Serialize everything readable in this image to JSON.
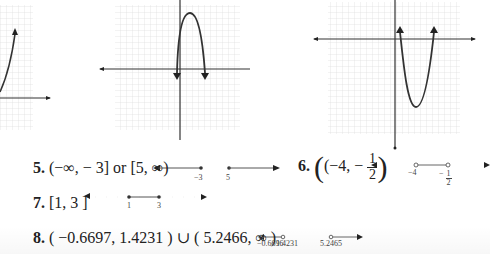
{
  "graphs": [
    {
      "id": "graph-partial-left",
      "description": "increasing curve with arrow, partially cropped"
    },
    {
      "id": "graph-downward-parabola",
      "description": "parabola opening down, vertex above x-axis"
    },
    {
      "id": "graph-upward-parabola",
      "description": "parabola opening up, vertex below x-axis"
    }
  ],
  "answers": [
    {
      "number": "5.",
      "text": "(−∞, − 3] or [5, ∞)",
      "number_line": {
        "labels": [
          "−3",
          "5"
        ],
        "endpoints": "closed"
      }
    },
    {
      "number": "6.",
      "text_before": "(−4, −",
      "frac_num": "1",
      "frac_den": "2",
      "text_after": ")",
      "number_line": {
        "labels": [
          "−4"
        ],
        "frac_label": {
          "sign": "−",
          "num": "1",
          "den": "2"
        },
        "endpoints": "open"
      }
    },
    {
      "number": "7.",
      "text": "[1, 3  ]",
      "number_line": {
        "labels": [
          "1",
          "3"
        ],
        "endpoints": "closed"
      }
    },
    {
      "number": "8.",
      "text": "( −0.6697, 1.4231 ) ∪ ( 5.2466, ∞ )",
      "number_line": {
        "labels": [
          "−0.6696",
          "1.4231",
          "5.2465"
        ],
        "endpoints": "open"
      }
    }
  ]
}
